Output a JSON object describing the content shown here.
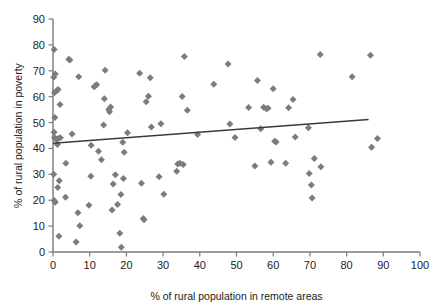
{
  "chart_data": {
    "type": "scatter",
    "title": "",
    "xlabel": "% of rural population in remote areas",
    "ylabel": "% of rural population in poverty",
    "xlim": [
      0,
      100
    ],
    "ylim": [
      0,
      90
    ],
    "xticks": [
      0,
      10,
      20,
      30,
      40,
      50,
      60,
      70,
      80,
      90,
      100
    ],
    "yticks": [
      0,
      10,
      20,
      30,
      40,
      50,
      60,
      70,
      80,
      90
    ],
    "xtick_labels": [
      "0",
      "10",
      "20",
      "30",
      "40",
      "50",
      "60",
      "70",
      "80",
      "90",
      "100"
    ],
    "ytick_labels": [
      "0",
      "10",
      "20",
      "30",
      "40",
      "50",
      "60",
      "70",
      "80",
      "90"
    ],
    "grid": false,
    "legend": false,
    "marker_shape": "diamond",
    "marker_color": "#7c7c7c",
    "trendline_color": "#3b3b3b",
    "series": [
      {
        "name": "countries",
        "points": [
          [
            0.3,
            78.2
          ],
          [
            0.2,
            67.5
          ],
          [
            0.6,
            68.8
          ],
          [
            0.4,
            61.5
          ],
          [
            1.0,
            62.3
          ],
          [
            1.4,
            62.8
          ],
          [
            1.9,
            57.0
          ],
          [
            0.5,
            52.0
          ],
          [
            0.3,
            46.3
          ],
          [
            0.4,
            44.2
          ],
          [
            0.9,
            43.5
          ],
          [
            1.4,
            43.8
          ],
          [
            2.0,
            44.1
          ],
          [
            1.2,
            41.5
          ],
          [
            0.2,
            30.0
          ],
          [
            0.3,
            19.9
          ],
          [
            0.6,
            19.2
          ],
          [
            1.3,
            24.9
          ],
          [
            1.7,
            27.5
          ],
          [
            1.6,
            6.1
          ],
          [
            3.5,
            34.3
          ],
          [
            3.4,
            21.1
          ],
          [
            4.3,
            74.5
          ],
          [
            4.6,
            74.2
          ],
          [
            5.2,
            45.6
          ],
          [
            6.3,
            3.9
          ],
          [
            6.8,
            15.2
          ],
          [
            7.0,
            67.7
          ],
          [
            7.3,
            10.1
          ],
          [
            9.8,
            18.1
          ],
          [
            10.3,
            29.3
          ],
          [
            10.4,
            41.2
          ],
          [
            11.2,
            63.8
          ],
          [
            11.6,
            64.3
          ],
          [
            11.9,
            64.6
          ],
          [
            12.4,
            38.9
          ],
          [
            13.2,
            35.6
          ],
          [
            14.2,
            70.2
          ],
          [
            14.0,
            59.2
          ],
          [
            13.8,
            49.1
          ],
          [
            15.2,
            55.0
          ],
          [
            15.4,
            54.2
          ],
          [
            15.7,
            56.0
          ],
          [
            16.1,
            16.2
          ],
          [
            16.4,
            26.3
          ],
          [
            17.0,
            29.8
          ],
          [
            17.6,
            18.3
          ],
          [
            18.2,
            7.2
          ],
          [
            18.6,
            1.8
          ],
          [
            18.5,
            22.2
          ],
          [
            19.2,
            28.4
          ],
          [
            19.4,
            38.5
          ],
          [
            19.0,
            42.4
          ],
          [
            20.3,
            46.1
          ],
          [
            23.6,
            69.0
          ],
          [
            24.1,
            26.6
          ],
          [
            24.6,
            12.9
          ],
          [
            24.8,
            12.5
          ],
          [
            26.5,
            67.3
          ],
          [
            26.0,
            60.2
          ],
          [
            25.4,
            58.0
          ],
          [
            26.8,
            48.3
          ],
          [
            28.9,
            29.1
          ],
          [
            29.4,
            49.5
          ],
          [
            30.2,
            22.3
          ],
          [
            33.7,
            31.2
          ],
          [
            34.0,
            34.0
          ],
          [
            34.6,
            34.3
          ],
          [
            35.5,
            33.8
          ],
          [
            35.2,
            60.1
          ],
          [
            35.8,
            75.5
          ],
          [
            36.6,
            54.8
          ],
          [
            39.4,
            45.4
          ],
          [
            43.8,
            64.8
          ],
          [
            47.7,
            72.6
          ],
          [
            48.2,
            49.4
          ],
          [
            49.6,
            44.2
          ],
          [
            53.3,
            55.8
          ],
          [
            55.0,
            33.2
          ],
          [
            55.7,
            66.2
          ],
          [
            56.6,
            47.6
          ],
          [
            57.4,
            55.9
          ],
          [
            58.1,
            55.3
          ],
          [
            58.6,
            55.5
          ],
          [
            59.4,
            34.7
          ],
          [
            60.0,
            63.1
          ],
          [
            60.4,
            42.8
          ],
          [
            60.8,
            42.5
          ],
          [
            63.4,
            34.3
          ],
          [
            64.2,
            55.7
          ],
          [
            65.4,
            58.9
          ],
          [
            66.0,
            44.4
          ],
          [
            69.6,
            48.0
          ],
          [
            69.8,
            30.3
          ],
          [
            70.4,
            25.9
          ],
          [
            70.6,
            20.9
          ],
          [
            71.2,
            36.1
          ],
          [
            72.8,
            76.3
          ],
          [
            73.0,
            32.9
          ],
          [
            81.5,
            67.7
          ],
          [
            86.5,
            76.0
          ],
          [
            86.8,
            40.5
          ],
          [
            88.4,
            43.8
          ]
        ]
      }
    ],
    "trendline": {
      "x_start": 0,
      "y_start": 42.0,
      "x_end": 86,
      "y_end": 51.2
    }
  }
}
